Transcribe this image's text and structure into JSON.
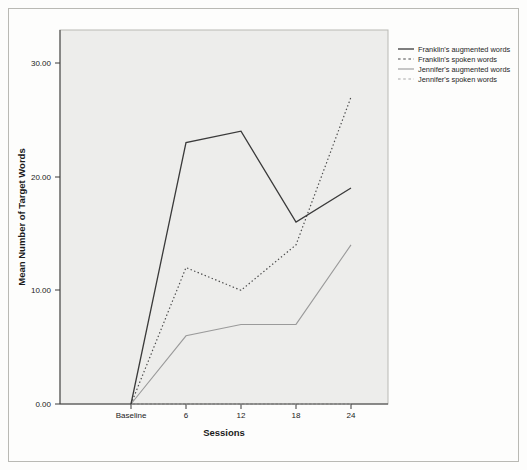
{
  "chart_data": {
    "type": "line",
    "title": "",
    "xlabel": "Sessions",
    "ylabel": "Mean Number of Target Words",
    "categories": [
      "Baseline",
      "6",
      "12",
      "18",
      "24"
    ],
    "x": [
      0,
      6,
      12,
      18,
      24
    ],
    "ylim": [
      0,
      33
    ],
    "xlim": [
      -2,
      27
    ],
    "yticks": [
      "0.00",
      "10.00",
      "20.00",
      "30.00"
    ],
    "ytick_values": [
      0,
      10,
      20,
      30
    ],
    "grid": false,
    "legend_position": "right-top",
    "series": [
      {
        "name": "Franklin's augmented words",
        "style": "solid",
        "color": "#3a3a3a",
        "values": [
          0,
          23,
          24,
          16,
          19
        ]
      },
      {
        "name": "Franklin's spoken words",
        "style": "dotted",
        "color": "#4a4a4a",
        "values": [
          0,
          12,
          10,
          14,
          27
        ]
      },
      {
        "name": "Jennifer's augmented words",
        "style": "solid",
        "color": "#9a9a9a",
        "values": [
          0,
          6,
          7,
          7,
          14
        ]
      },
      {
        "name": "Jennifer's spoken words",
        "style": "dotted",
        "color": "#a8a8a8",
        "values": [
          0,
          0,
          0,
          0,
          0
        ]
      }
    ]
  },
  "plot": {
    "background_color": "#ededeb",
    "border_color": "#b9b9b4",
    "axis_color": "#3a3a3a"
  }
}
